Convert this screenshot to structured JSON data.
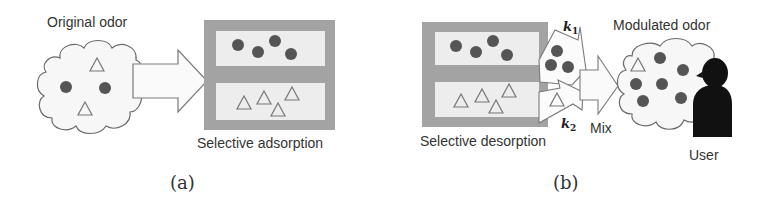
{
  "panel_a": {
    "cloud_label": "Original odor",
    "box_label": "Selective adsorption",
    "caption": "(a)",
    "cloud_contents": {
      "circles": 2,
      "triangles": 2
    },
    "top_chamber": {
      "circles": 4
    },
    "bottom_chamber": {
      "triangles": 4
    }
  },
  "panel_b": {
    "box_label": "Selective desorption",
    "rate_k1": "k",
    "rate_k1_sub": "1",
    "rate_k2": "k",
    "rate_k2_sub": "2",
    "mix_label": "Mix",
    "cloud_label": "Modulated odor",
    "user_label": "User",
    "caption": "(b)",
    "top_chamber": {
      "circles": 4
    },
    "bottom_chamber": {
      "triangles": 4
    },
    "k1_stream": {
      "circles": 3
    },
    "k2_stream": {
      "triangles": 1
    },
    "cloud_contents": {
      "circles": 7,
      "triangles": 1
    }
  },
  "colors": {
    "box_gray": "#a3a3a3",
    "chamber_fill": "#ededed",
    "molecule": "#555555",
    "outline": "#6a6a6a",
    "user": "#111111",
    "cloud_fill": "#f7f7f7"
  }
}
